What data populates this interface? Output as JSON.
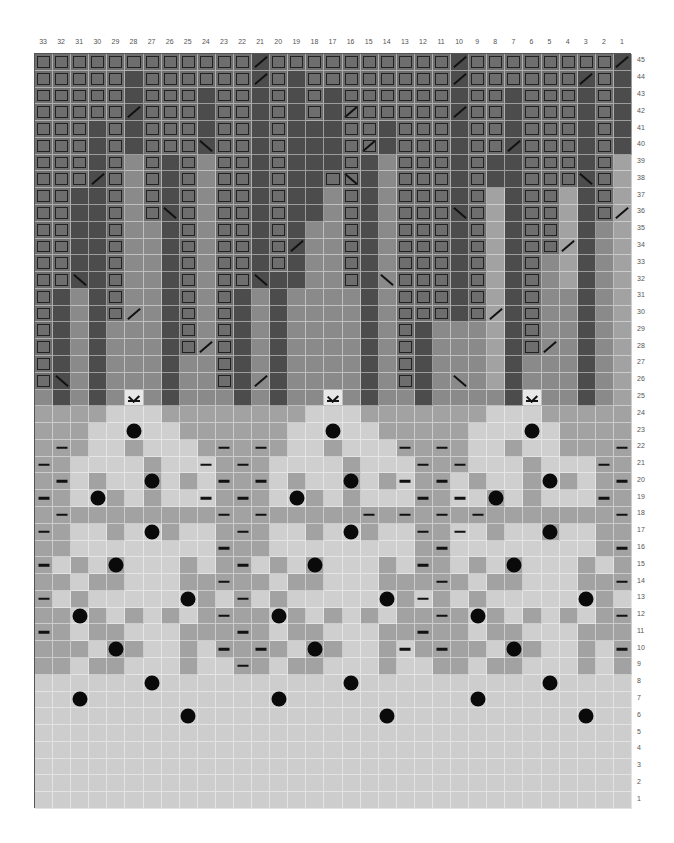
{
  "chart": {
    "columns": 33,
    "rows": 45,
    "column_labels": [
      "33",
      "32",
      "31",
      "30",
      "29",
      "28",
      "27",
      "26",
      "25",
      "24",
      "23",
      "22",
      "21",
      "20",
      "19",
      "18",
      "17",
      "16",
      "15",
      "14",
      "13",
      "12",
      "11",
      "10",
      "9",
      "8",
      "7",
      "6",
      "5",
      "4",
      "3",
      "2",
      "1"
    ],
    "row_labels": [
      "45",
      "44",
      "43",
      "42",
      "41",
      "40",
      "39",
      "38",
      "37",
      "36",
      "35",
      "34",
      "33",
      "32",
      "31",
      "30",
      "29",
      "28",
      "27",
      "26",
      "25",
      "24",
      "23",
      "22",
      "21",
      "20",
      "19",
      "18",
      "17",
      "16",
      "15",
      "14",
      "13",
      "12",
      "11",
      "10",
      "9",
      "8",
      "7",
      "6",
      "5",
      "4",
      "3",
      "2",
      "1"
    ],
    "legend_tones": {
      "B": "boxed stitch (medium gray with dark outline)",
      "D": "dark gray",
      "M": "medium gray",
      "G": "mid-light gray",
      "L": "light gray",
      "l": "very light gray"
    },
    "tone_colors": {
      "B": "#6e6e6e",
      "D": "#4c4c4c",
      "M": "#8a8a8a",
      "G": "#a2a2a2",
      "L": "#cfcfcf",
      "l": "#cdcdcd"
    },
    "tone_rows": [
      "BBBBBBBBBBBBDBBBBBBBBBBDBBBBBBBBD",
      "BBBBBDBBBBBBDBDBBBBBBBBDBBBBBBDBD",
      "BBBBBDBBBDBBDBDBDBBBBBBDBBDBBBDBD",
      "BBBBBDBBBDBBDBDBDBBBBBBDBBDBBBDBD",
      "BBBDBDBBBDBBDBDDDBBDBBBDBBDBBBDBD",
      "BBBDBDBBBDBBDBDDDBBDBBBDBBDBBBDBD",
      "BBBDBMBDBMBBDBDDDBDMBBBDBDDBBBDBG",
      "BBBDBMBDBMBBDBDDBBDMBBBDBDDBBBDBG",
      "BBDDBMBDBMBBDBDDMBDMBBBDBGDBBGDBG",
      "BBDDBMBDBMBBDBDDMBDMBBBDBGDBBGDBG",
      "BBDDBMMDBMBBDBDMMBDMBBBDBGDBBGDMG",
      "BBDDBMMDBMBBDBDMMBDMBBBDBGDBBGDMG",
      "BBDDBMMDBMBBDBDMMBDMBBBDBGDBMGDMG",
      "BBDDBMMDBMBBDDDMMBDMBBBDBGDBMGDMG",
      "BDMDBMMDBMBDMDMMMMDMBBBDBGDBMMDMG",
      "BDMDBMMDBMBDMDMMMMDMBBBDBGDBMMDMG",
      "BDMDMMMDBMBDMDMMMMDMBDMMMGDBMMDMG",
      "BDMDMMMDBMBDMDMMMMDMBDMMMGDBMMDMG",
      "BDMDMMMDMMBDMDMMMMDMBDMMMGDMMMDMG",
      "BDMDMMMDMMBDMDMMMMDMBDMMMGDMMMDMG",
      "MDMDMMMDMMMDMDMMMMDMMDMMMMDMMMDMG",
      "GGGGLLLGGGGGGGGLLLGGGGGGGLLLGGGGG",
      "GGGLLLLLGGGGGGLLLLLGGGGGLLLLLGGGG",
      "GGGLLGLLLGGGGGLLGLLLGGGGLLGLLGGGG",
      "GGLLLLGLLLGGGLLLLGLLLGGGLLLGLLLGG",
      "GGLGLLGLGLGGGLGLLGLGLGGLGLLGLGLGG",
      "GGLLGLGLLLGGGLLGLGLLLGGLLGLGLLLGG",
      "GGGGGGGGGGGGGGGGGGGGGGGGGGGGGGGGG",
      "GGLLGLLGLLGGGLLGLLGLLGGLLGLLGLLGG",
      "GGLLLLLLLLGGGLLLLLLLLGGLLLLLLLLGG",
      "GLGLGLLLGLGGLGLGLLLGLGGLGLGLLLGLG",
      "GGLGGLLLGGGGGLGGLLLGGGGGLGGLLLGGG",
      "GLGLLLLLLGLGLGLLLLLLGLGLGLLLLLLGL",
      "GGLGLGLGLGGGGLGLGLGLGGGGLGLGLGLGG",
      "GGLGGLLLGGGGGLGGLLLGGGGGLGGLLLGGG",
      "GGGLGGLLGLGGGGLGGLLGLGGGGLGGLLGLG",
      "GGLGGLLLGLLGGLGGLLLGLLGGLGGLLLGLG",
      "llllllllllllllllllllllllllllllllll",
      "lllllllllllllllllllllllllllllllll",
      "lllllllllllllllllllllllllllllllll",
      "lllllllllllllllllllllllllllllllll",
      "lllllllllllllllllllllllllllllllll",
      "lllllllllllllllllllllllllllllllll",
      "lllllllllllllllllllllllllllllllll",
      "lllllllllllllllllllllllllllllllll"
    ],
    "symbol_legend": {
      "/": "right-leaning slash (decrease)",
      "\\": "left-leaning slash (decrease)",
      "k": "inverted-v over bar symbol",
      "o": "filled dot (bobble)",
      "-": "dash (purl)"
    },
    "symbols": [
      {
        "row": 45,
        "col": 21,
        "s": "/"
      },
      {
        "row": 45,
        "col": 10,
        "s": "/"
      },
      {
        "row": 45,
        "col": 1,
        "s": "/"
      },
      {
        "row": 44,
        "col": 21,
        "s": "/"
      },
      {
        "row": 44,
        "col": 10,
        "s": "/"
      },
      {
        "row": 44,
        "col": 3,
        "s": "/"
      },
      {
        "row": 42,
        "col": 28,
        "s": "/"
      },
      {
        "row": 42,
        "col": 16,
        "s": "/"
      },
      {
        "row": 42,
        "col": 10,
        "s": "/"
      },
      {
        "row": 40,
        "col": 24,
        "s": "\\"
      },
      {
        "row": 40,
        "col": 15,
        "s": "/"
      },
      {
        "row": 40,
        "col": 7,
        "s": "/"
      },
      {
        "row": 38,
        "col": 30,
        "s": "/"
      },
      {
        "row": 38,
        "col": 16,
        "s": "\\"
      },
      {
        "row": 38,
        "col": 3,
        "s": "\\"
      },
      {
        "row": 36,
        "col": 26,
        "s": "\\"
      },
      {
        "row": 36,
        "col": 10,
        "s": "\\"
      },
      {
        "row": 36,
        "col": 1,
        "s": "/"
      },
      {
        "row": 34,
        "col": 19,
        "s": "/"
      },
      {
        "row": 34,
        "col": 4,
        "s": "/"
      },
      {
        "row": 32,
        "col": 31,
        "s": "\\"
      },
      {
        "row": 32,
        "col": 21,
        "s": "\\"
      },
      {
        "row": 32,
        "col": 14,
        "s": "\\"
      },
      {
        "row": 30,
        "col": 28,
        "s": "/"
      },
      {
        "row": 30,
        "col": 8,
        "s": "/"
      },
      {
        "row": 28,
        "col": 24,
        "s": "/"
      },
      {
        "row": 28,
        "col": 5,
        "s": "/"
      },
      {
        "row": 26,
        "col": 32,
        "s": "\\"
      },
      {
        "row": 26,
        "col": 21,
        "s": "/"
      },
      {
        "row": 26,
        "col": 10,
        "s": "\\"
      },
      {
        "row": 25,
        "col": 28,
        "s": "k"
      },
      {
        "row": 25,
        "col": 17,
        "s": "k"
      },
      {
        "row": 25,
        "col": 6,
        "s": "k"
      },
      {
        "row": 23,
        "col": 28,
        "s": "o"
      },
      {
        "row": 23,
        "col": 17,
        "s": "o"
      },
      {
        "row": 23,
        "col": 6,
        "s": "o"
      },
      {
        "row": 22,
        "col": 32,
        "s": "-"
      },
      {
        "row": 22,
        "col": 23,
        "s": "-"
      },
      {
        "row": 22,
        "col": 21,
        "s": "-"
      },
      {
        "row": 22,
        "col": 13,
        "s": "-"
      },
      {
        "row": 22,
        "col": 11,
        "s": "-"
      },
      {
        "row": 22,
        "col": 1,
        "s": "-"
      },
      {
        "row": 21,
        "col": 33,
        "s": "-"
      },
      {
        "row": 21,
        "col": 24,
        "s": "-"
      },
      {
        "row": 21,
        "col": 22,
        "s": "-"
      },
      {
        "row": 21,
        "col": 12,
        "s": "-"
      },
      {
        "row": 21,
        "col": 10,
        "s": "-"
      },
      {
        "row": 21,
        "col": 2,
        "s": "-"
      },
      {
        "row": 20,
        "col": 32,
        "s": "-"
      },
      {
        "row": 20,
        "col": 27,
        "s": "o"
      },
      {
        "row": 20,
        "col": 23,
        "s": "-"
      },
      {
        "row": 20,
        "col": 21,
        "s": "-"
      },
      {
        "row": 20,
        "col": 16,
        "s": "o"
      },
      {
        "row": 20,
        "col": 13,
        "s": "-"
      },
      {
        "row": 20,
        "col": 11,
        "s": "-"
      },
      {
        "row": 20,
        "col": 5,
        "s": "o"
      },
      {
        "row": 20,
        "col": 1,
        "s": "-"
      },
      {
        "row": 19,
        "col": 33,
        "s": "-"
      },
      {
        "row": 19,
        "col": 30,
        "s": "o"
      },
      {
        "row": 19,
        "col": 24,
        "s": "-"
      },
      {
        "row": 19,
        "col": 22,
        "s": "-"
      },
      {
        "row": 19,
        "col": 19,
        "s": "o"
      },
      {
        "row": 19,
        "col": 12,
        "s": "-"
      },
      {
        "row": 19,
        "col": 10,
        "s": "-"
      },
      {
        "row": 19,
        "col": 8,
        "s": "o"
      },
      {
        "row": 19,
        "col": 2,
        "s": "-"
      },
      {
        "row": 18,
        "col": 32,
        "s": "-"
      },
      {
        "row": 18,
        "col": 23,
        "s": "-"
      },
      {
        "row": 18,
        "col": 21,
        "s": "-"
      },
      {
        "row": 18,
        "col": 15,
        "s": "-"
      },
      {
        "row": 18,
        "col": 13,
        "s": "-"
      },
      {
        "row": 18,
        "col": 11,
        "s": "-"
      },
      {
        "row": 18,
        "col": 9,
        "s": "-"
      },
      {
        "row": 18,
        "col": 1,
        "s": "-"
      },
      {
        "row": 17,
        "col": 33,
        "s": "-"
      },
      {
        "row": 17,
        "col": 27,
        "s": "o"
      },
      {
        "row": 17,
        "col": 22,
        "s": "-"
      },
      {
        "row": 17,
        "col": 16,
        "s": "o"
      },
      {
        "row": 17,
        "col": 12,
        "s": "-"
      },
      {
        "row": 17,
        "col": 10,
        "s": "-"
      },
      {
        "row": 17,
        "col": 5,
        "s": "o"
      },
      {
        "row": 16,
        "col": 23,
        "s": "-"
      },
      {
        "row": 16,
        "col": 11,
        "s": "-"
      },
      {
        "row": 16,
        "col": 1,
        "s": "-"
      },
      {
        "row": 15,
        "col": 33,
        "s": "-"
      },
      {
        "row": 15,
        "col": 29,
        "s": "o"
      },
      {
        "row": 15,
        "col": 22,
        "s": "-"
      },
      {
        "row": 15,
        "col": 18,
        "s": "o"
      },
      {
        "row": 15,
        "col": 12,
        "s": "-"
      },
      {
        "row": 15,
        "col": 7,
        "s": "o"
      },
      {
        "row": 14,
        "col": 23,
        "s": "-"
      },
      {
        "row": 14,
        "col": 11,
        "s": "-"
      },
      {
        "row": 14,
        "col": 1,
        "s": "-"
      },
      {
        "row": 13,
        "col": 33,
        "s": "-"
      },
      {
        "row": 13,
        "col": 25,
        "s": "o"
      },
      {
        "row": 13,
        "col": 22,
        "s": "-"
      },
      {
        "row": 13,
        "col": 14,
        "s": "o"
      },
      {
        "row": 13,
        "col": 12,
        "s": "-"
      },
      {
        "row": 13,
        "col": 3,
        "s": "o"
      },
      {
        "row": 12,
        "col": 31,
        "s": "o"
      },
      {
        "row": 12,
        "col": 23,
        "s": "-"
      },
      {
        "row": 12,
        "col": 20,
        "s": "o"
      },
      {
        "row": 12,
        "col": 11,
        "s": "-"
      },
      {
        "row": 12,
        "col": 9,
        "s": "o"
      },
      {
        "row": 12,
        "col": 1,
        "s": "-"
      },
      {
        "row": 11,
        "col": 33,
        "s": "-"
      },
      {
        "row": 11,
        "col": 22,
        "s": "-"
      },
      {
        "row": 11,
        "col": 12,
        "s": "-"
      },
      {
        "row": 10,
        "col": 29,
        "s": "o"
      },
      {
        "row": 10,
        "col": 23,
        "s": "-"
      },
      {
        "row": 10,
        "col": 21,
        "s": "-"
      },
      {
        "row": 10,
        "col": 18,
        "s": "o"
      },
      {
        "row": 10,
        "col": 13,
        "s": "-"
      },
      {
        "row": 10,
        "col": 11,
        "s": "-"
      },
      {
        "row": 10,
        "col": 7,
        "s": "o"
      },
      {
        "row": 10,
        "col": 1,
        "s": "-"
      },
      {
        "row": 9,
        "col": 22,
        "s": "-"
      },
      {
        "row": 8,
        "col": 27,
        "s": "o"
      },
      {
        "row": 8,
        "col": 16,
        "s": "o"
      },
      {
        "row": 8,
        "col": 5,
        "s": "o"
      },
      {
        "row": 7,
        "col": 31,
        "s": "o"
      },
      {
        "row": 7,
        "col": 20,
        "s": "o"
      },
      {
        "row": 7,
        "col": 9,
        "s": "o"
      },
      {
        "row": 6,
        "col": 25,
        "s": "o"
      },
      {
        "row": 6,
        "col": 14,
        "s": "o"
      },
      {
        "row": 6,
        "col": 3,
        "s": "o"
      }
    ]
  }
}
